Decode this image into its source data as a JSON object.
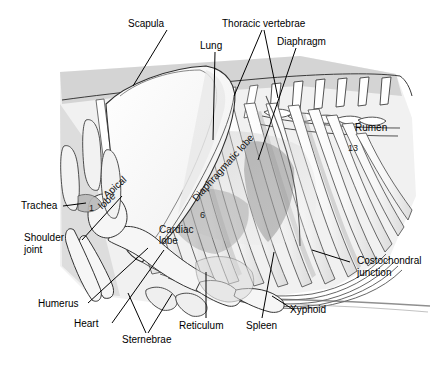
{
  "figure": {
    "background_color": "#ffffff",
    "ink_color": "#000000",
    "tissue_fill": "#f4f4f4",
    "shadow_gray": "#d9d9d9"
  },
  "callouts": [
    {
      "id": "scapula",
      "label": "Scapula"
    },
    {
      "id": "lung",
      "label": "Lung"
    },
    {
      "id": "thoracic-vertebrae",
      "label": "Thoracic vertebrae"
    },
    {
      "id": "diaphragm",
      "label": "Diaphragm"
    },
    {
      "id": "rumen",
      "label": "Rumen"
    },
    {
      "id": "trachea",
      "label": "Trachea"
    },
    {
      "id": "shoulder-joint-line1",
      "label": "Shoulder"
    },
    {
      "id": "shoulder-joint-line2",
      "label": "joint"
    },
    {
      "id": "humerus",
      "label": "Humerus"
    },
    {
      "id": "heart",
      "label": "Heart"
    },
    {
      "id": "sternebrae",
      "label": "Sternebrae"
    },
    {
      "id": "reticulum",
      "label": "Reticulum"
    },
    {
      "id": "spleen",
      "label": "Spleen"
    },
    {
      "id": "xyphoid",
      "label": "Xyphoid"
    },
    {
      "id": "costochondral-line1",
      "label": "Costochondral"
    },
    {
      "id": "costochondral-line2",
      "label": "junction"
    }
  ],
  "labels": {
    "scapula": "Scapula",
    "lung": "Lung",
    "thoracic_vertebrae": "Thoracic vertebrae",
    "diaphragm": "Diaphragm",
    "rumen": "Rumen",
    "trachea": "Trachea",
    "shoulder_joint_line1": "Shoulder",
    "shoulder_joint_line2": "joint",
    "humerus": "Humerus",
    "heart": "Heart",
    "sternebrae": "Sternebrae",
    "reticulum": "Reticulum",
    "spleen": "Spleen",
    "xyphoid": "Xyphoid",
    "costochondral_line1": "Costochondral",
    "costochondral_line2": "junction"
  },
  "inline_labels": {
    "diaphragmatic_lobe": "Diaphragmatic lobe",
    "apical_lobe_line1": "Apical",
    "apical_lobe_line2": "lobe",
    "cardiac_lobe_line1": "Cardiac",
    "cardiac_lobe_line2": "lobe"
  },
  "rib_numbers": {
    "first": "1",
    "sixth": "6",
    "thirteenth": "13"
  }
}
